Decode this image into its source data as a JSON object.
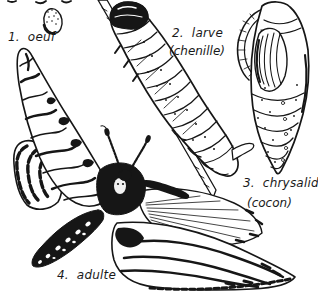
{
  "background_color": "#ffffff",
  "ink_color": "#161616",
  "stages": [
    {
      "number": "1.",
      "label": "oeuf",
      "sublabel": "",
      "illustration": "egg-illustration"
    },
    {
      "number": "2.",
      "label": "larve",
      "sublabel": "(chenille)",
      "illustration": "caterpillar-on-branch-illustration"
    },
    {
      "number": "3.",
      "label": "chrysalide",
      "sublabel": "(cocon)",
      "illustration": "chrysalis-illustration"
    },
    {
      "number": "4.",
      "label": "adulte",
      "sublabel": "",
      "illustration": "adult-moth-illustration"
    }
  ]
}
